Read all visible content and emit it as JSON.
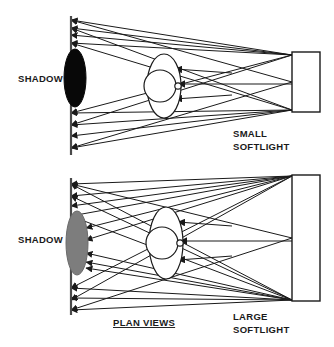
{
  "diagram": {
    "title": "PLAN VIEWS",
    "title_underlined": true,
    "panels": [
      {
        "id": "small-softlight-panel",
        "shadow_label": "SHADOW",
        "shadow_type": "hard",
        "shadow_color": "#080808",
        "light_label_line1": "SMALL",
        "light_label_line2": "SOFTLIGHT",
        "source_height_px": 60,
        "wall_arrow_count": 8,
        "subject_arrow_count": 3
      },
      {
        "id": "large-softlight-panel",
        "shadow_label": "SHADOW",
        "shadow_type": "soft",
        "shadow_color": "#7d7d7d",
        "light_label_line1": "LARGE",
        "light_label_line2": "SOFTLIGHT",
        "source_height_px": 126,
        "wall_arrow_count": 10,
        "subject_arrow_count": 3
      }
    ],
    "colors": {
      "stroke": "#1a1a1a",
      "background": "#ffffff",
      "hard_shadow": "#080808",
      "soft_shadow": "#7d7d7d",
      "source_fill": "#ffffff"
    }
  }
}
